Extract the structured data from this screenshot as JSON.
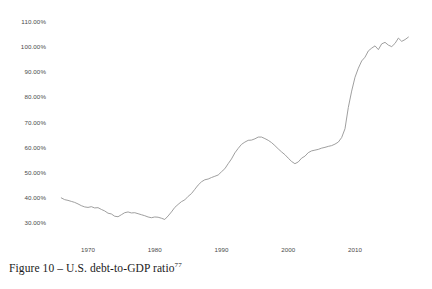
{
  "figure": {
    "caption_text": "Figure 10 – U.S. debt-to-GDP ratio",
    "caption_footnote": "77"
  },
  "style": {
    "line_color": "#949494",
    "text_color": "#4a4a4a",
    "caption_color": "#1a1a1a",
    "background": "#ffffff"
  },
  "chart_data": {
    "type": "line",
    "title": "",
    "xlabel": "",
    "ylabel": "",
    "xlim": [
      1965.5,
      2018.5
    ],
    "ylim": [
      27.0,
      112.0
    ],
    "grid": false,
    "legend": "none",
    "y_tick_labels": [
      "110.00%",
      "100.00%",
      "90.00%",
      "80.00%",
      "70.00%",
      "60.00%",
      "50.00%",
      "40.00%",
      "30.00%"
    ],
    "y_tick_values": [
      110,
      100,
      90,
      80,
      70,
      60,
      50,
      40,
      30
    ],
    "x_tick_labels": [
      "1970",
      "1980",
      "1990",
      "2000",
      "2010"
    ],
    "x_tick_values": [
      1970,
      1980,
      1990,
      2000,
      2010
    ],
    "series": [
      {
        "name": "U.S. debt-to-GDP ratio",
        "x": [
          1966.0,
          1966.5,
          1967.0,
          1967.5,
          1968.0,
          1968.5,
          1969.0,
          1969.5,
          1970.0,
          1970.5,
          1971.0,
          1971.5,
          1972.0,
          1972.5,
          1973.0,
          1973.5,
          1974.0,
          1974.5,
          1975.0,
          1975.5,
          1976.0,
          1976.5,
          1977.0,
          1977.5,
          1978.0,
          1978.5,
          1979.0,
          1979.5,
          1980.0,
          1980.5,
          1981.0,
          1981.5,
          1982.0,
          1982.5,
          1983.0,
          1983.5,
          1984.0,
          1984.5,
          1985.0,
          1985.5,
          1986.0,
          1986.5,
          1987.0,
          1987.5,
          1988.0,
          1988.5,
          1989.0,
          1989.5,
          1990.0,
          1990.5,
          1991.0,
          1991.5,
          1992.0,
          1992.5,
          1993.0,
          1993.5,
          1994.0,
          1994.5,
          1995.0,
          1995.5,
          1996.0,
          1996.5,
          1997.0,
          1997.5,
          1998.0,
          1998.5,
          1999.0,
          1999.5,
          2000.0,
          2000.5,
          2001.0,
          2001.5,
          2002.0,
          2002.5,
          2003.0,
          2003.5,
          2004.0,
          2004.5,
          2005.0,
          2005.5,
          2006.0,
          2006.5,
          2007.0,
          2007.5,
          2008.0,
          2008.5,
          2009.0,
          2009.5,
          2010.0,
          2010.5,
          2011.0,
          2011.5,
          2012.0,
          2012.5,
          2013.0,
          2013.5,
          2014.0,
          2014.5,
          2015.0,
          2015.5,
          2016.0,
          2016.5,
          2017.0,
          2017.5,
          2018.0
        ],
        "y": [
          40.0,
          39.3,
          39.0,
          38.6,
          38.2,
          37.6,
          36.9,
          36.4,
          36.2,
          36.5,
          36.0,
          36.1,
          35.4,
          34.8,
          33.9,
          33.6,
          32.7,
          32.5,
          33.3,
          34.1,
          34.4,
          34.0,
          34.1,
          33.7,
          33.3,
          32.9,
          32.4,
          32.1,
          32.4,
          32.3,
          31.9,
          31.4,
          32.8,
          34.4,
          36.2,
          37.4,
          38.5,
          39.2,
          40.6,
          41.7,
          43.4,
          45.1,
          46.4,
          47.2,
          47.5,
          48.1,
          48.6,
          49.1,
          50.4,
          51.6,
          53.6,
          55.5,
          57.9,
          59.7,
          61.3,
          62.2,
          62.9,
          63.0,
          63.5,
          64.2,
          64.2,
          63.6,
          62.9,
          62.0,
          60.8,
          59.5,
          58.3,
          57.2,
          55.8,
          54.5,
          53.6,
          54.3,
          55.8,
          56.6,
          58.0,
          58.7,
          59.0,
          59.3,
          59.8,
          60.1,
          60.5,
          60.8,
          61.4,
          62.2,
          64.0,
          67.5,
          76.0,
          82.5,
          88.0,
          91.6,
          94.5,
          96.0,
          98.5,
          99.6,
          100.5,
          99.0,
          101.3,
          101.9,
          100.8,
          100.2,
          101.5,
          103.6,
          102.3,
          103.0,
          104.0
        ]
      }
    ]
  }
}
